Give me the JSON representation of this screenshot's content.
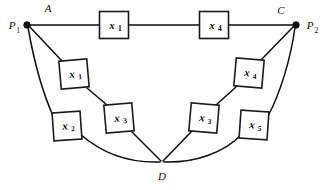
{
  "figure": {
    "type": "reliability-block-diagram",
    "width": 324,
    "height": 190,
    "background": "#ffffff",
    "line_color": "#0d0d0d",
    "box_fill": "#ffffff",
    "box_stroke": "#1a1a1a"
  },
  "nodes": [
    {
      "id": "P1",
      "base": "P",
      "sub": "1",
      "label": "P₁",
      "x": 27,
      "y": 25,
      "tag": "A",
      "tag_x": 48,
      "tag_y": 12,
      "label_x": 12,
      "label_y": 29
    },
    {
      "id": "P2",
      "base": "P",
      "sub": "2",
      "label": "P₂",
      "x": 296,
      "y": 25,
      "tag": "C",
      "tag_x": 281,
      "tag_y": 14,
      "label_x": 310,
      "label_y": 29
    },
    {
      "id": "D",
      "base": "D",
      "sub": "",
      "label": "D",
      "x": 162,
      "y": 162,
      "tag": "",
      "tag_x": 0,
      "tag_y": 0,
      "label_x": 162,
      "label_y": 180
    }
  ],
  "blocks": [
    {
      "id": "top-x1",
      "base": "x",
      "sub": "1",
      "label": "x₁",
      "cx": 114,
      "cy": 25,
      "w": 29,
      "h": 27,
      "rot": 0,
      "path": "top"
    },
    {
      "id": "top-x4",
      "base": "x",
      "sub": "4",
      "label": "x₄",
      "cx": 214,
      "cy": 25,
      "w": 29,
      "h": 27,
      "rot": 0,
      "path": "top"
    },
    {
      "id": "mid-left-x1",
      "base": "x",
      "sub": "1",
      "label": "x₁",
      "cx": 74,
      "cy": 74,
      "w": 28,
      "h": 28,
      "rot": -5,
      "path": "middle-left"
    },
    {
      "id": "mid-left-x3",
      "base": "x",
      "sub": "3",
      "label": "x₃",
      "cx": 119,
      "cy": 118,
      "w": 28,
      "h": 28,
      "rot": -5,
      "path": "middle-left"
    },
    {
      "id": "outer-left-x2",
      "base": "x",
      "sub": "2",
      "label": "x₂",
      "cx": 67,
      "cy": 126,
      "w": 28,
      "h": 28,
      "rot": -4,
      "path": "outer-left"
    },
    {
      "id": "mid-right-x4",
      "base": "x",
      "sub": "4",
      "label": "x₄",
      "cx": 249,
      "cy": 73,
      "w": 28,
      "h": 28,
      "rot": 5,
      "path": "middle-right"
    },
    {
      "id": "mid-right-x3",
      "base": "x",
      "sub": "3",
      "label": "x₃",
      "cx": 204,
      "cy": 118,
      "w": 28,
      "h": 28,
      "rot": 5,
      "path": "middle-right"
    },
    {
      "id": "outer-right-x5",
      "base": "x",
      "sub": "5",
      "label": "x₅",
      "cx": 254,
      "cy": 125,
      "w": 28,
      "h": 28,
      "rot": 4,
      "path": "outer-right"
    }
  ],
  "edges": [
    {
      "id": "e-p1-topx1",
      "d": "M 29 25 L 99 25",
      "kind": "straight"
    },
    {
      "id": "e-topx1-topx4",
      "d": "M 129 25 L 199 25",
      "kind": "straight"
    },
    {
      "id": "e-topx4-p2",
      "d": "M 229 25 L 295 25",
      "kind": "straight"
    },
    {
      "id": "e-p1-midx1",
      "d": "M 29 26 L 62 61",
      "kind": "straight"
    },
    {
      "id": "e-midx1-midx3",
      "d": "M 87 88 L 107 105",
      "kind": "straight"
    },
    {
      "id": "e-midx3-d",
      "d": "M 131 131 L 161 161",
      "kind": "straight"
    },
    {
      "id": "e-d-midx3r",
      "d": "M 163 161 L 192 131",
      "kind": "straight"
    },
    {
      "id": "e-midx3r-midx4r",
      "d": "M 216 105 L 236 87",
      "kind": "straight"
    },
    {
      "id": "e-midx4r-p2",
      "d": "M 261 60 L 294 26",
      "kind": "straight"
    },
    {
      "id": "e-p1-outx2",
      "d": "M 28 27 C 34 62 44 96 54 118",
      "kind": "curve"
    },
    {
      "id": "e-outx2-d",
      "d": "M 80 134 C 104 155 133 163 160 162",
      "kind": "curve"
    },
    {
      "id": "e-d-outx5",
      "d": "M 164 162 C 195 163 224 153 242 134",
      "kind": "curve"
    },
    {
      "id": "e-outx5-p2",
      "d": "M 268 116 C 280 94 291 58 295 27",
      "kind": "curve"
    }
  ]
}
